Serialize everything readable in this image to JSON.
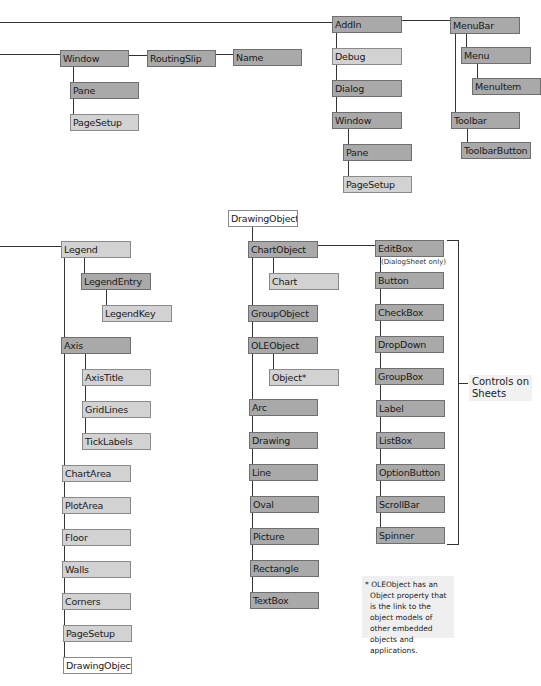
{
  "diagram": {
    "colors": {
      "dark_node": "#a9a9a9",
      "light_node": "#d2d2d2",
      "white_node": "#ffffff",
      "line": "#333333"
    },
    "nodes": [
      {
        "id": "window-left",
        "label": "Window",
        "x": 60,
        "y": 50,
        "w": 69,
        "style": "dark"
      },
      {
        "id": "routingslip",
        "label": "RoutingSlip",
        "x": 147,
        "y": 50,
        "w": 69,
        "style": "dark"
      },
      {
        "id": "name",
        "label": "Name",
        "x": 233,
        "y": 49,
        "w": 69,
        "style": "dark"
      },
      {
        "id": "pane-left",
        "label": "Pane",
        "x": 70,
        "y": 82,
        "w": 69,
        "style": "dark"
      },
      {
        "id": "pagesetup-left",
        "label": "PageSetup",
        "x": 70,
        "y": 114,
        "w": 69,
        "style": "light"
      },
      {
        "id": "addin",
        "label": "AddIn",
        "x": 332,
        "y": 16,
        "w": 70,
        "style": "dark"
      },
      {
        "id": "debug",
        "label": "Debug",
        "x": 332,
        "y": 48,
        "w": 70,
        "style": "light"
      },
      {
        "id": "dialog",
        "label": "Dialog",
        "x": 332,
        "y": 80,
        "w": 70,
        "style": "dark"
      },
      {
        "id": "window-right",
        "label": "Window",
        "x": 332,
        "y": 112,
        "w": 70,
        "style": "dark"
      },
      {
        "id": "pane-right",
        "label": "Pane",
        "x": 343,
        "y": 144,
        "w": 69,
        "style": "dark"
      },
      {
        "id": "pagesetup-right",
        "label": "PageSetup",
        "x": 343,
        "y": 176,
        "w": 69,
        "style": "light"
      },
      {
        "id": "menubar",
        "label": "MenuBar",
        "x": 450,
        "y": 17,
        "w": 70,
        "style": "dark"
      },
      {
        "id": "menu",
        "label": "Menu",
        "x": 461,
        "y": 47,
        "w": 70,
        "style": "dark"
      },
      {
        "id": "menuitem",
        "label": "MenuItem",
        "x": 472,
        "y": 78,
        "w": 69,
        "style": "dark"
      },
      {
        "id": "toolbar",
        "label": "Toolbar",
        "x": 451,
        "y": 112,
        "w": 69,
        "style": "dark"
      },
      {
        "id": "toolbarbutton",
        "label": "ToolbarButton",
        "x": 461,
        "y": 142,
        "w": 70,
        "style": "dark"
      },
      {
        "id": "legend",
        "label": "Legend",
        "x": 61,
        "y": 241,
        "w": 70,
        "style": "light"
      },
      {
        "id": "legendentry",
        "label": "LegendEntry",
        "x": 81,
        "y": 273,
        "w": 70,
        "style": "dark"
      },
      {
        "id": "legendkey",
        "label": "LegendKey",
        "x": 102,
        "y": 305,
        "w": 70,
        "style": "light"
      },
      {
        "id": "axis",
        "label": "Axis",
        "x": 61,
        "y": 337,
        "w": 70,
        "style": "dark"
      },
      {
        "id": "axistitle",
        "label": "AxisTitle",
        "x": 82,
        "y": 369,
        "w": 69,
        "style": "light"
      },
      {
        "id": "gridlines",
        "label": "GridLines",
        "x": 82,
        "y": 401,
        "w": 69,
        "style": "light"
      },
      {
        "id": "ticklabels",
        "label": "TickLabels",
        "x": 82,
        "y": 433,
        "w": 69,
        "style": "light"
      },
      {
        "id": "chartarea",
        "label": "ChartArea",
        "x": 62,
        "y": 465,
        "w": 69,
        "style": "light"
      },
      {
        "id": "plotarea",
        "label": "PlotArea",
        "x": 62,
        "y": 497,
        "w": 69,
        "style": "light"
      },
      {
        "id": "floor",
        "label": "Floor",
        "x": 62,
        "y": 529,
        "w": 69,
        "style": "light"
      },
      {
        "id": "walls",
        "label": "Walls",
        "x": 62,
        "y": 561,
        "w": 69,
        "style": "light"
      },
      {
        "id": "corners",
        "label": "Corners",
        "x": 62,
        "y": 593,
        "w": 69,
        "style": "light"
      },
      {
        "id": "pagesetup-chart",
        "label": "PageSetup",
        "x": 63,
        "y": 625,
        "w": 69,
        "style": "light"
      },
      {
        "id": "drawingobjects-chart",
        "label": "DrawingObjects",
        "x": 63,
        "y": 657,
        "w": 69,
        "style": "white"
      },
      {
        "id": "drawingobjects",
        "label": "DrawingObjects",
        "x": 228,
        "y": 210,
        "w": 70,
        "style": "white"
      },
      {
        "id": "chartobject",
        "label": "ChartObject",
        "x": 248,
        "y": 241,
        "w": 70,
        "style": "dark"
      },
      {
        "id": "chart",
        "label": "Chart",
        "x": 269,
        "y": 273,
        "w": 70,
        "style": "light"
      },
      {
        "id": "groupobject",
        "label": "GroupObject",
        "x": 248,
        "y": 305,
        "w": 70,
        "style": "dark"
      },
      {
        "id": "oleobject",
        "label": "OLEObject",
        "x": 248,
        "y": 337,
        "w": 70,
        "style": "dark"
      },
      {
        "id": "object",
        "label": "Object*",
        "x": 269,
        "y": 369,
        "w": 70,
        "style": "light"
      },
      {
        "id": "arc",
        "label": "Arc",
        "x": 249,
        "y": 399,
        "w": 69,
        "style": "dark"
      },
      {
        "id": "drawing",
        "label": "Drawing",
        "x": 249,
        "y": 432,
        "w": 69,
        "style": "dark"
      },
      {
        "id": "line",
        "label": "Line",
        "x": 249,
        "y": 464,
        "w": 69,
        "style": "dark"
      },
      {
        "id": "oval",
        "label": "Oval",
        "x": 250,
        "y": 496,
        "w": 69,
        "style": "dark"
      },
      {
        "id": "picture",
        "label": "Picture",
        "x": 250,
        "y": 528,
        "w": 69,
        "style": "dark"
      },
      {
        "id": "rectangle",
        "label": "Rectangle",
        "x": 250,
        "y": 560,
        "w": 69,
        "style": "dark"
      },
      {
        "id": "textbox",
        "label": "TextBox",
        "x": 250,
        "y": 592,
        "w": 69,
        "style": "dark"
      },
      {
        "id": "editbox",
        "label": "EditBox",
        "x": 375,
        "y": 240,
        "w": 69,
        "style": "dark"
      },
      {
        "id": "button",
        "label": "Button",
        "x": 375,
        "y": 272,
        "w": 69,
        "style": "dark"
      },
      {
        "id": "checkbox",
        "label": "CheckBox",
        "x": 375,
        "y": 304,
        "w": 69,
        "style": "dark"
      },
      {
        "id": "dropdown",
        "label": "DropDown",
        "x": 375,
        "y": 336,
        "w": 69,
        "style": "dark"
      },
      {
        "id": "groupbox",
        "label": "GroupBox",
        "x": 375,
        "y": 368,
        "w": 69,
        "style": "dark"
      },
      {
        "id": "label",
        "label": "Label",
        "x": 376,
        "y": 400,
        "w": 69,
        "style": "dark"
      },
      {
        "id": "listbox",
        "label": "ListBox",
        "x": 376,
        "y": 432,
        "w": 69,
        "style": "dark"
      },
      {
        "id": "optionbutton",
        "label": "OptionButton",
        "x": 376,
        "y": 464,
        "w": 69,
        "style": "dark"
      },
      {
        "id": "scrollbar",
        "label": "ScrollBar",
        "x": 376,
        "y": 496,
        "w": 69,
        "style": "dark"
      },
      {
        "id": "spinner",
        "label": "Spinner",
        "x": 376,
        "y": 527,
        "w": 69,
        "style": "dark"
      }
    ],
    "lines": [
      {
        "type": "h",
        "x": 0,
        "y": 22,
        "len": 333
      },
      {
        "type": "h",
        "x": 0,
        "y": 54,
        "len": 61
      },
      {
        "type": "h",
        "x": 128,
        "y": 55,
        "len": 20
      },
      {
        "type": "h",
        "x": 215,
        "y": 54,
        "len": 19
      },
      {
        "type": "v",
        "x": 73,
        "y": 66,
        "len": 49
      },
      {
        "type": "v",
        "x": 336,
        "y": 32,
        "len": 81
      },
      {
        "type": "h",
        "x": 401,
        "y": 20,
        "len": 50
      },
      {
        "type": "v",
        "x": 348,
        "y": 128,
        "len": 49
      },
      {
        "type": "v",
        "x": 455,
        "y": 33,
        "len": 80
      },
      {
        "type": "v",
        "x": 466,
        "y": 33,
        "len": 15
      },
      {
        "type": "v",
        "x": 477,
        "y": 63,
        "len": 16
      },
      {
        "type": "v",
        "x": 467,
        "y": 128,
        "len": 15
      },
      {
        "type": "h",
        "x": 0,
        "y": 246,
        "len": 62
      },
      {
        "type": "v",
        "x": 64,
        "y": 258,
        "len": 400
      },
      {
        "type": "v",
        "x": 84,
        "y": 258,
        "len": 16
      },
      {
        "type": "v",
        "x": 106,
        "y": 290,
        "len": 16
      },
      {
        "type": "v",
        "x": 85,
        "y": 354,
        "len": 80
      },
      {
        "type": "v",
        "x": 252,
        "y": 227,
        "len": 366
      },
      {
        "type": "v",
        "x": 273,
        "y": 258,
        "len": 16
      },
      {
        "type": "v",
        "x": 273,
        "y": 354,
        "len": 16
      },
      {
        "type": "h",
        "x": 317,
        "y": 245,
        "len": 59
      },
      {
        "type": "v",
        "x": 380,
        "y": 257,
        "len": 271
      }
    ],
    "editbox_note": "(DialogSheet only)",
    "bracket": {
      "x": 447,
      "y": 240,
      "w": 11,
      "h": 303,
      "tick_x": 458,
      "tick_y": 383,
      "tick_len": 10
    },
    "controls_label": {
      "line1": "Controls on",
      "line2": "Sheets"
    },
    "footnote": "* OLEObject has an Object property that is the link to the object models of other embedded objects and applications."
  }
}
